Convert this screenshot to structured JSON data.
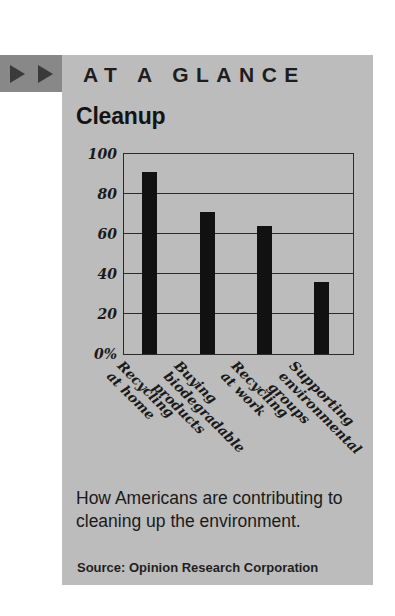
{
  "header": {
    "title": "AT A GLANCE",
    "marker_icons": [
      "triangle-right-icon",
      "triangle-right-icon"
    ],
    "block_color": "#888888",
    "panel_color": "#bcbcbc"
  },
  "chart_title": "Cleanup",
  "caption": "How Americans are contributing to cleaning up the environment.",
  "source": "Source: Opinion Research Corporation",
  "chart_data": {
    "type": "bar",
    "title": "Cleanup",
    "categories": [
      "Recycling\nat home",
      "Buying\nbiodegradable\nproducts",
      "Recycling\nat work",
      "Supporting\nenvironmental\ngroups"
    ],
    "values": [
      91,
      71,
      64,
      36
    ],
    "xlabel": "",
    "ylabel": "",
    "ylim": [
      0,
      100
    ],
    "yticks": [
      0,
      20,
      40,
      60,
      80,
      100
    ],
    "ytick_labels": [
      "0%",
      "20",
      "40",
      "60",
      "80",
      "100"
    ],
    "grid": true,
    "legend": false,
    "bar_color": "#111111",
    "units": "percent"
  }
}
